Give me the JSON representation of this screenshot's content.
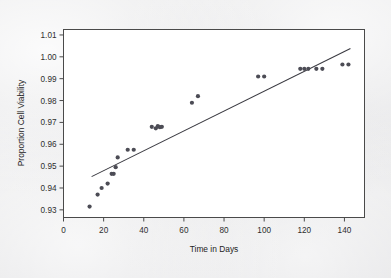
{
  "figure": {
    "background_color": "#e7e7e9",
    "plot_background_color": "#ffffff",
    "frame_color": "#4a4a4a",
    "marker_color": "#4c4c55",
    "line_color": "#3b3b42"
  },
  "chart_data": {
    "type": "scatter",
    "title": "",
    "xlabel": "Time in Days",
    "ylabel": "Proportion Cell Viability",
    "xlim": [
      0,
      150
    ],
    "ylim": [
      0.9265,
      1.0125
    ],
    "grid": false,
    "legend": null,
    "xticks": [
      0,
      20,
      40,
      60,
      80,
      100,
      120,
      140
    ],
    "xtick_labels": [
      "0",
      "20",
      "40",
      "60",
      "80",
      "100",
      "120",
      "140"
    ],
    "yticks": [
      0.93,
      0.94,
      0.95,
      0.96,
      0.97,
      0.98,
      0.99,
      1.0,
      1.01
    ],
    "ytick_labels": [
      "0.93",
      "0.94",
      "0.95",
      "0.96",
      "0.97",
      "0.98",
      "0.99",
      "1.00",
      "1.01"
    ],
    "series": [
      {
        "name": "Observations",
        "marker": "circle",
        "x": [
          13,
          17,
          19,
          22,
          24,
          25,
          26,
          27,
          32,
          35,
          44,
          46,
          47,
          48,
          49,
          64,
          67,
          97,
          100,
          118,
          120,
          122,
          126,
          129,
          139,
          142
        ],
        "y": [
          0.9315,
          0.937,
          0.94,
          0.942,
          0.9465,
          0.9465,
          0.9495,
          0.954,
          0.9575,
          0.9575,
          0.968,
          0.9673,
          0.9683,
          0.9678,
          0.968,
          0.979,
          0.982,
          0.991,
          0.991,
          0.9945,
          0.9945,
          0.9945,
          0.9945,
          0.9945,
          0.9965,
          0.9965
        ]
      }
    ],
    "trendline": {
      "name": "Least-squares fit",
      "x_start": 14,
      "y_start": 0.9452,
      "x_end": 143,
      "y_end": 1.0038
    }
  }
}
